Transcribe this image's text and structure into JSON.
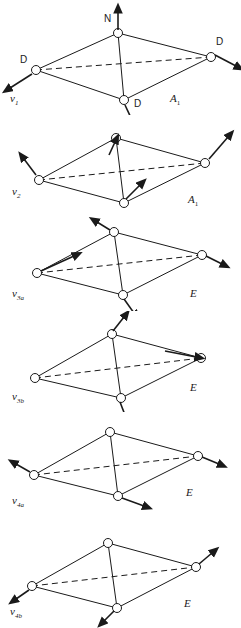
{
  "figure": {
    "type": "molecular-vibration-diagram",
    "molecule": "ND3",
    "atom_labels": {
      "nitrogen": "N",
      "deuterium": "D"
    },
    "colors": {
      "line": "#1a1a1a",
      "background": "#ffffff",
      "atom_fill": "#ffffff"
    }
  },
  "panels": [
    {
      "index": 0,
      "mode": "ν",
      "mode_sub": "1",
      "symmetry": "A",
      "symmetry_sub": "1",
      "atom_labels_shown": [
        "N",
        "D",
        "D",
        "D"
      ],
      "arrow_note": "N up; three D outward"
    },
    {
      "index": 1,
      "mode": "ν",
      "mode_sub": "2",
      "symmetry": "A",
      "symmetry_sub": "1",
      "atom_labels_shown": [],
      "arrow_note": "umbrella bend"
    },
    {
      "index": 2,
      "mode": "ν",
      "mode_sub": "3a",
      "symmetry": "E",
      "symmetry_sub": "",
      "atom_labels_shown": [],
      "arrow_note": "degenerate stretch a"
    },
    {
      "index": 3,
      "mode": "ν",
      "mode_sub": "3b",
      "symmetry": "E",
      "symmetry_sub": "",
      "atom_labels_shown": [],
      "arrow_note": "degenerate stretch b"
    },
    {
      "index": 4,
      "mode": "ν",
      "mode_sub": "4a",
      "symmetry": "E",
      "symmetry_sub": "",
      "atom_labels_shown": [],
      "arrow_note": "degenerate bend a"
    },
    {
      "index": 5,
      "mode": "ν",
      "mode_sub": "4b",
      "symmetry": "E",
      "symmetry_sub": "",
      "atom_labels_shown": [],
      "arrow_note": "degenerate bend b"
    }
  ]
}
